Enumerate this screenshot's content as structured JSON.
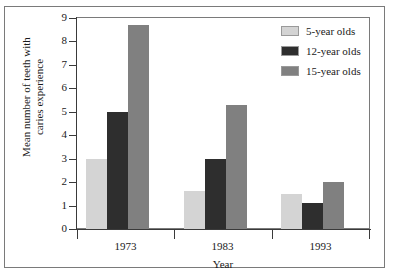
{
  "chart_data": {
    "type": "bar",
    "title": "",
    "xlabel": "Year",
    "ylabel": "Mean number of teeth with caries experience",
    "ylabel_line1": "Mean number of teeth with",
    "ylabel_line2": "caries experience",
    "categories": [
      "1973",
      "1983",
      "1993"
    ],
    "series": [
      {
        "name": "5-year olds",
        "color": "#d4d4d4",
        "values": [
          3.0,
          1.6,
          1.5
        ]
      },
      {
        "name": "12-year olds",
        "color": "#2e2e2e",
        "values": [
          5.0,
          3.0,
          1.1
        ]
      },
      {
        "name": "15-year olds",
        "color": "#808080",
        "values": [
          8.7,
          5.3,
          2.0
        ]
      }
    ],
    "ylim": [
      0,
      9
    ],
    "yticks": [
      0,
      1,
      2,
      3,
      4,
      5,
      6,
      7,
      8,
      9
    ],
    "ytick_labels": [
      "0",
      "1",
      "2",
      "3",
      "4",
      "5",
      "6",
      "7",
      "8",
      "9"
    ],
    "grid": false,
    "legend_position": "top-right"
  },
  "legend": {
    "items": [
      {
        "label": "5-year olds",
        "color": "#d4d4d4"
      },
      {
        "label": "12-year olds",
        "color": "#2e2e2e"
      },
      {
        "label": "15-year olds",
        "color": "#808080"
      }
    ]
  },
  "colors": {
    "frame": "#7a7a7a",
    "axis": "#3a3a3a",
    "text": "#1a1a1a",
    "background": "#ffffff"
  }
}
